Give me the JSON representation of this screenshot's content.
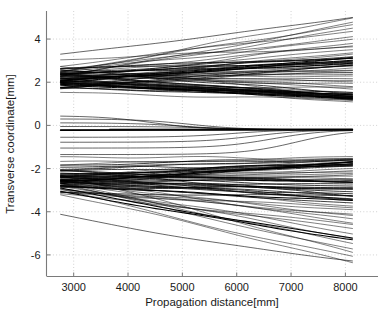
{
  "chart_data": {
    "type": "line",
    "title": "",
    "xlabel": "Propagation distance[mm]",
    "ylabel": "Transverse coordinate[mm]",
    "xlim": [
      2500,
      8600
    ],
    "ylim": [
      -7.0,
      5.3
    ],
    "xticks": [
      3000,
      4000,
      5000,
      6000,
      7000,
      8000
    ],
    "xticklabels": [
      "3000",
      "4000",
      "5000",
      "6000",
      "7000",
      "8000"
    ],
    "yticks": [
      4,
      2,
      0,
      -2,
      -4,
      -6
    ],
    "yticklabels": [
      "4",
      "2",
      "0",
      "-2",
      "-4",
      "-6"
    ],
    "grid": true,
    "grid_style": "dotted",
    "grid_color": "#b4b4b4",
    "line_color": "#000000",
    "line_width": 0.55,
    "legend": null,
    "x_data_start": 2760,
    "x_data_end": 8130,
    "series": [
      {
        "name": "upper-fan",
        "y_start_center": 2.0,
        "y_start_spread": [
          0.65,
          3.3
        ],
        "y_end_spread": [
          1.1,
          5.0
        ],
        "count": 62
      },
      {
        "name": "converging-group",
        "y_start_spread": [
          -1.4,
          0.45
        ],
        "y_end": -0.2,
        "count": 9
      },
      {
        "name": "lower-fan",
        "y_start_center": -2.7,
        "y_start_spread": [
          -4.15,
          -1.35
        ],
        "y_end_spread": [
          -6.3,
          -1.5
        ],
        "count": 60
      }
    ],
    "dense_bands_right": [
      3.1,
      2.85,
      1.45,
      1.25,
      -0.2,
      -1.7,
      -2.6,
      -3.5,
      -5.2
    ],
    "dense_bands_left": [
      2.0,
      1.85,
      -2.7,
      -2.8
    ]
  },
  "axes": {
    "spine_color": "#7a7a7a",
    "tick_color": "#7a7a7a"
  }
}
